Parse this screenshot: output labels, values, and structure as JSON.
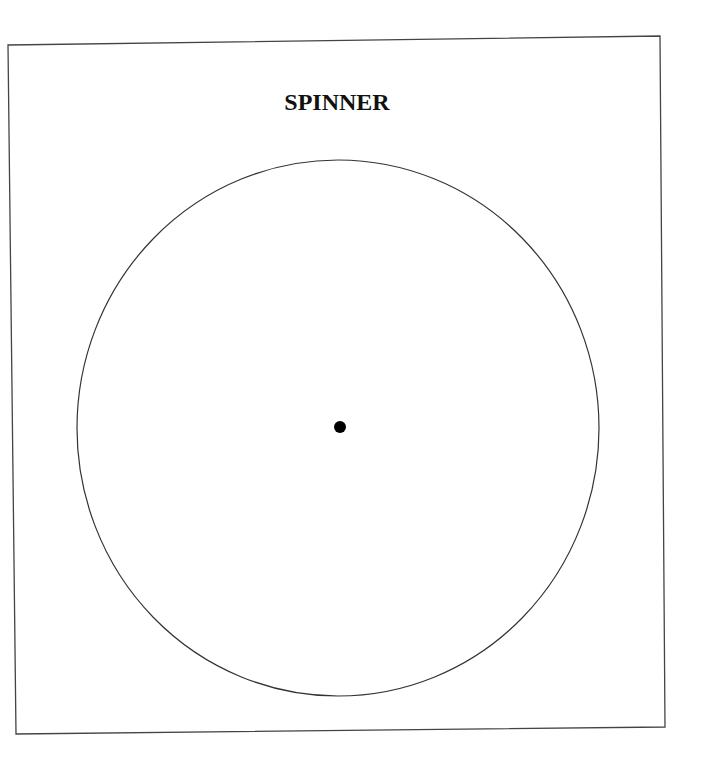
{
  "diagram": {
    "title": "SPINNER",
    "frame": {
      "corners": {
        "top_left": [
          8,
          45
        ],
        "top_right": [
          660,
          36
        ],
        "bottom_right": [
          665,
          727
        ],
        "bottom_left": [
          16,
          734
        ]
      },
      "stroke_color": "#444444"
    },
    "spinner_circle": {
      "center": [
        338,
        428
      ],
      "radius_x": 261,
      "radius_y": 268,
      "stroke_color": "#333333"
    },
    "center_dot": {
      "center": [
        340,
        427
      ],
      "radius": 6,
      "fill_color": "#000000"
    }
  }
}
